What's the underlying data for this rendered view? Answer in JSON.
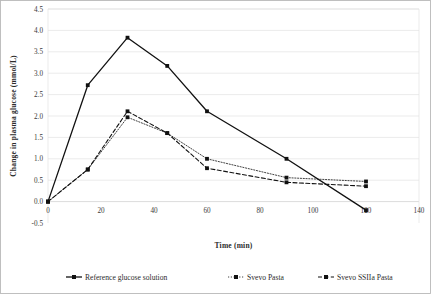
{
  "figure": {
    "background_color": "#ffffff",
    "frame_color": "#b9b9b9",
    "line_color": "#111111",
    "grid_color": "#e2e2e2"
  },
  "chart_data": {
    "type": "line",
    "title": "",
    "subtitle": "",
    "xlabel": "Time (min)",
    "ylabel": "Change in plasma glucose (mmol/L)",
    "x": [
      0,
      15,
      30,
      45,
      60,
      90,
      120
    ],
    "xlim": [
      0,
      140
    ],
    "ylim": [
      -0.5,
      4.5
    ],
    "xticks": [
      0,
      20,
      40,
      60,
      80,
      100,
      120,
      140
    ],
    "xtick_labels": [
      "0",
      "20",
      "40",
      "60",
      "80",
      "100",
      "120",
      "140"
    ],
    "yticks": [
      -0.5,
      0.0,
      0.5,
      1.0,
      1.5,
      2.0,
      2.5,
      3.0,
      3.5,
      4.0,
      4.5
    ],
    "ytick_labels": [
      "-0.5",
      "0.0",
      "0.5",
      "1.0",
      "1.5",
      "2.0",
      "2.5",
      "3.0",
      "3.5",
      "4.0",
      "4.5"
    ],
    "grid": true,
    "grid_axis": "y",
    "legend_position": "bottom",
    "series": [
      {
        "name": "Reference glucose solution",
        "values": [
          0.0,
          2.72,
          3.83,
          3.17,
          2.11,
          1.0,
          -0.2
        ],
        "line_style": "solid",
        "line_width": 1.3,
        "marker": "square",
        "color": "#111111"
      },
      {
        "name": "Svevo Pasta",
        "values": [
          0.0,
          0.75,
          1.97,
          1.6,
          1.0,
          0.56,
          0.47
        ],
        "line_style": "dotted",
        "line_width": 0.8,
        "marker": "square",
        "color": "#111111"
      },
      {
        "name": "Svevo SSIIa Pasta",
        "values": [
          0.0,
          0.75,
          2.11,
          1.6,
          0.78,
          0.45,
          0.36
        ],
        "line_style": "dashed",
        "line_width": 1.1,
        "marker": "square",
        "color": "#111111"
      }
    ]
  },
  "legend": {
    "items": [
      {
        "label": "Reference glucose solution",
        "style": "solid"
      },
      {
        "label": "Svevo Pasta",
        "style": "dotted"
      },
      {
        "label": "Svevo SSIIa Pasta",
        "style": "dashed"
      }
    ]
  }
}
